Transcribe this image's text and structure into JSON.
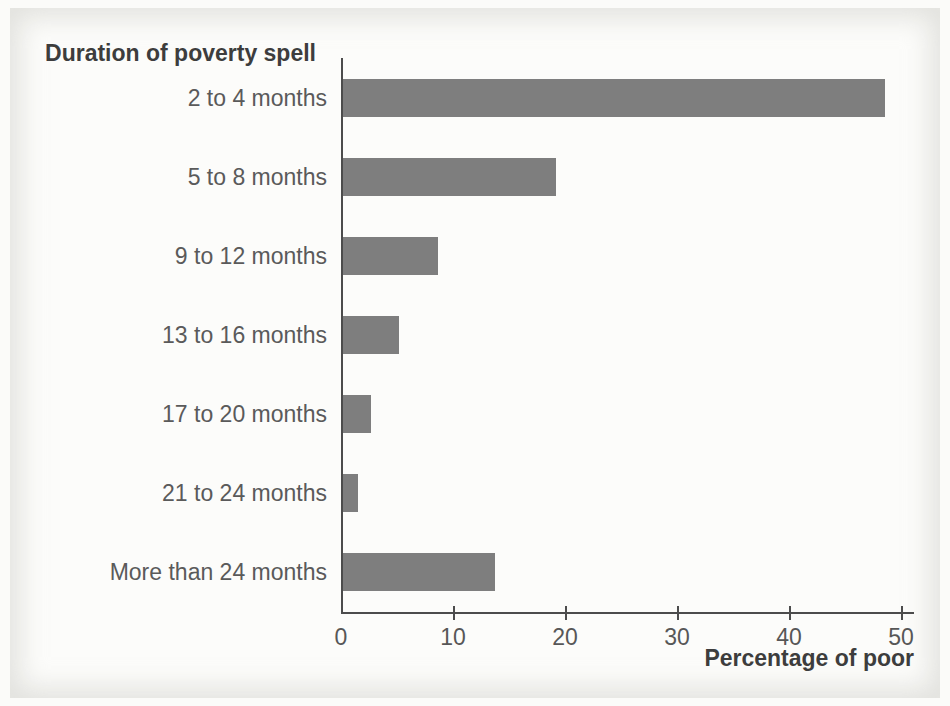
{
  "chart_data": {
    "type": "bar",
    "orientation": "horizontal",
    "title": "",
    "xlabel": "Percentage of poor",
    "ylabel": "Duration of poverty spell",
    "categories": [
      "2 to 4 months",
      "5 to 8 months",
      "9 to 12 months",
      "13 to 16 months",
      "17 to 20 months",
      "21 to 24 months",
      "More than 24 months"
    ],
    "values": [
      48.4,
      19.0,
      8.5,
      5.0,
      2.5,
      1.3,
      13.6
    ],
    "xlim": [
      0,
      50
    ],
    "xticks": [
      0,
      10,
      20,
      30,
      40,
      50
    ],
    "xtick_labels": [
      "0",
      "10",
      "20",
      "30",
      "40",
      "50"
    ],
    "grid": false,
    "legend": null,
    "bar_color": "#7e7e7e",
    "axis_color": "#4c4c4c",
    "background_color": "#fcfcfa"
  }
}
